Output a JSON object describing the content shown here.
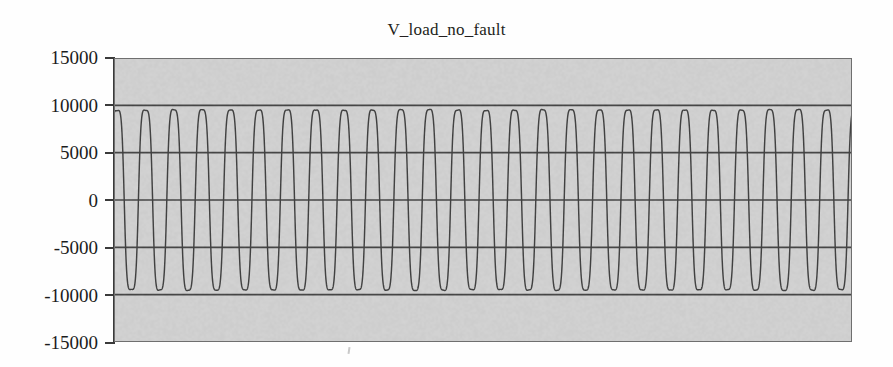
{
  "figure": {
    "width": 893,
    "height": 367,
    "background_color": "#fefefe",
    "plot_background_color": "#d6d6d6",
    "line_color": "#3a3a3a",
    "grid_color": "#3f3f3f",
    "axis_color": "#3a3a3a"
  },
  "chart_data": {
    "type": "line",
    "title": "V_load_no_fault",
    "xlabel": "",
    "ylabel": "",
    "ylim": [
      -15000,
      15000
    ],
    "ytick_labels": [
      "15000",
      "10000",
      "5000",
      "0",
      "-5000",
      "-10000",
      "-15000"
    ],
    "ytick_values": [
      15000,
      10000,
      5000,
      0,
      -5000,
      -10000,
      -15000
    ],
    "xtick_labels": [],
    "grid": true,
    "grid_axis": "y",
    "gridlines_at": [
      10000,
      5000,
      0,
      -5000,
      -10000
    ],
    "legend": null,
    "series": [
      {
        "name": "V_load_no_fault",
        "waveform": "sine",
        "amplitude": 10000,
        "offset": 0,
        "cycles_visible": 26,
        "peak_value": 10000,
        "trough_value": -10000,
        "description": "Steady-state sinusoidal load voltage, no fault, constant amplitude of 10000 V peak across the full record."
      }
    ]
  }
}
